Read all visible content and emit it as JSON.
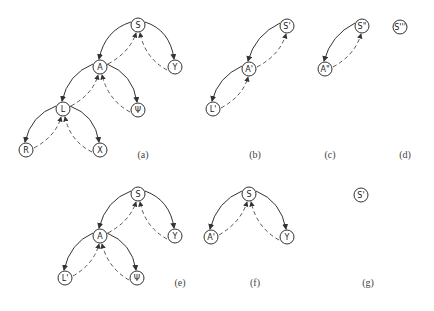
{
  "diagrams": [
    {
      "caption": "(a)",
      "nodes": [
        {
          "label": "S",
          "x": 138,
          "y": 25
        },
        {
          "label": "A",
          "x": 100,
          "y": 67
        },
        {
          "label": "Y",
          "x": 175,
          "y": 67
        },
        {
          "label": "L",
          "x": 63,
          "y": 109
        },
        {
          "label": "Ψ",
          "x": 138,
          "y": 110
        },
        {
          "label": "R",
          "x": 26,
          "y": 150
        },
        {
          "label": "X",
          "x": 100,
          "y": 150
        }
      ]
    },
    {
      "caption": "(b)",
      "nodes": [
        {
          "label": "S'",
          "x": 287,
          "y": 26
        },
        {
          "label": "A'",
          "x": 249,
          "y": 69
        },
        {
          "label": "L'",
          "x": 213,
          "y": 109
        }
      ]
    },
    {
      "caption": "(c)",
      "nodes": [
        {
          "label": "S\"",
          "x": 362,
          "y": 26
        },
        {
          "label": "A\"",
          "x": 325,
          "y": 69
        }
      ]
    },
    {
      "caption": "(d)",
      "nodes": [
        {
          "label": "S'''",
          "x": 400,
          "y": 27
        }
      ]
    },
    {
      "caption": "(e)",
      "nodes": [
        {
          "label": "S",
          "x": 138,
          "y": 194
        },
        {
          "label": "A",
          "x": 100,
          "y": 236
        },
        {
          "label": "Y",
          "x": 175,
          "y": 236
        },
        {
          "label": "L'",
          "x": 65,
          "y": 278
        },
        {
          "label": "Ψ",
          "x": 137,
          "y": 278
        }
      ]
    },
    {
      "caption": "(f)",
      "nodes": [
        {
          "label": "S",
          "x": 249,
          "y": 194
        },
        {
          "label": "A'",
          "x": 211,
          "y": 237
        },
        {
          "label": "Y",
          "x": 287,
          "y": 237
        }
      ]
    },
    {
      "caption": "(g)",
      "nodes": [
        {
          "label": "S'",
          "x": 361,
          "y": 195
        }
      ]
    }
  ],
  "captions": {
    "a": "(a)",
    "b": "(b)",
    "c": "(c)",
    "d": "(d)",
    "e": "(e)",
    "f": "(f)",
    "g": "(g)"
  },
  "labels": {
    "a_S": "S",
    "a_A": "A",
    "a_Y": "Y",
    "a_L": "L",
    "a_Psi": "Ψ",
    "a_R": "R",
    "a_X": "X",
    "b_S": "S'",
    "b_A": "A'",
    "b_L": "L'",
    "c_S": "S\"",
    "c_A": "A\"",
    "d_S": "S'''",
    "e_S": "S",
    "e_A": "A",
    "e_Y": "Y",
    "e_L": "L'",
    "e_Psi": "Ψ",
    "f_S": "S",
    "f_A": "A'",
    "f_Y": "Y",
    "g_S": "S'"
  }
}
